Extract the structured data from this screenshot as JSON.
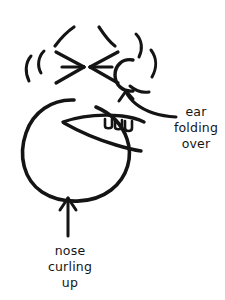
{
  "canvas": {
    "width": 225,
    "height": 300,
    "background_color": "#ffffff",
    "ink_color": "#141414",
    "medium": "hand-drawn black ink line sketch"
  },
  "figure": {
    "parts": [
      {
        "name": "head-outline",
        "description": "large rounded blob forming the head"
      },
      {
        "name": "snout-curl",
        "description": "curled upper lip / nose line across the face"
      },
      {
        "name": "mouth",
        "description": "open snarling mouth"
      },
      {
        "name": "teeth",
        "count": 3,
        "description": "three small teeth along the upper jaw"
      },
      {
        "name": "ear",
        "description": "C-shaped folded ear at upper right"
      },
      {
        "name": "squint-lines",
        "description": "curved strokes indicating squeezed-shut eyes"
      },
      {
        "name": "motion-arcs",
        "count": 6,
        "description": "radiating arcs showing movement"
      },
      {
        "name": "converging-arrows",
        "count": 2,
        "description": "two arrows pointing toward each other at the eyes"
      }
    ]
  },
  "annotations": [
    {
      "id": "ear-annotation",
      "lines": [
        "ear",
        "folding",
        "over"
      ],
      "full_text": "ear folding over",
      "pointer": "curved arrow from the label up-left to the ear",
      "align": "center"
    },
    {
      "id": "nose-annotation",
      "lines": [
        "nose",
        "curling",
        "up"
      ],
      "full_text": "nose curling up",
      "pointer": "straight arrow pointing up to the underside of the head",
      "align": "center"
    }
  ]
}
